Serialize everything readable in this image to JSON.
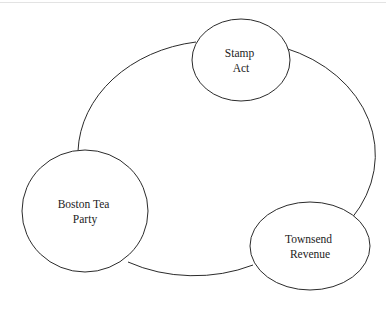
{
  "diagram": {
    "title": "",
    "type": "cycle-diagram",
    "background_color": "#ffffff",
    "stroke_color": "#2b2b2b",
    "text_color": "#1c1c1c",
    "top_rule_color": "#e3e3e3",
    "nodes": [
      {
        "id": "stamp-act",
        "shape": "ellipse",
        "lines": [
          "Stamp",
          "Act"
        ],
        "cx": 241,
        "cy": 60,
        "rx": 49,
        "ry": 41
      },
      {
        "id": "boston-tea-party",
        "shape": "circle",
        "lines": [
          "Boston Tea",
          "Party"
        ],
        "cx": 85,
        "cy": 211,
        "rx": 63,
        "ry": 61
      },
      {
        "id": "townsend-revenue",
        "shape": "ellipse",
        "lines": [
          "Townsend",
          "Revenue"
        ],
        "cx": 310,
        "cy": 246,
        "rx": 60,
        "ry": 44
      }
    ],
    "cycle_arcs": [
      {
        "id": "arc-boston-to-stamp",
        "from": "boston-tea-party",
        "to": "stamp-act",
        "path": "M 78,151 A 139,114 0 0 1 196,42"
      },
      {
        "id": "arc-stamp-to-townsend",
        "from": "stamp-act",
        "to": "townsend-revenue",
        "path": "M 285,48 A 139,114 0 0 1 352,218"
      },
      {
        "id": "arc-townsend-to-boston",
        "from": "townsend-revenue",
        "to": "boston-tea-party",
        "path": "M 253,265 A 139,114 0 0 1 128,262"
      }
    ]
  }
}
